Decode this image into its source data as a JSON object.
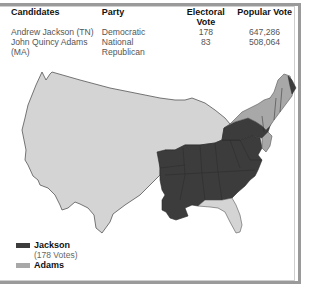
{
  "table": {
    "headers": [
      "Candidates",
      "Party",
      "Electoral Vote",
      "Popular Vote"
    ],
    "rows": [
      {
        "candidate": "Andrew Jackson (TN)",
        "party": "Democratic",
        "electoral": "178",
        "popular": "647,286"
      },
      {
        "candidate": "John Quincy Adams (MA)",
        "party": "National Republican",
        "electoral": "83",
        "popular": "508,064"
      }
    ]
  },
  "legend": {
    "items": [
      {
        "label": "Jackson",
        "sublabel": "(178 Votes)",
        "color": "#3c3c3c"
      },
      {
        "label": "Adams",
        "color": "#a8a8a8"
      }
    ]
  },
  "colors": {
    "jackson": "#3c3c3c",
    "adams": "#a8a8a8",
    "territory": "#d4d4d4",
    "border": "#555555",
    "frame": "#9a9a9a"
  }
}
